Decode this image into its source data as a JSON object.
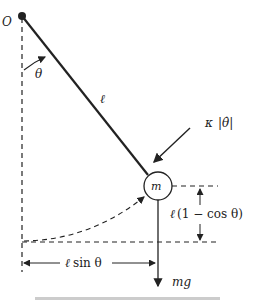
{
  "diagram": {
    "labels": {
      "pivot": "O",
      "angle": "θ",
      "length": "ℓ",
      "mass": "m",
      "damping_k": "κ",
      "damping_theta": "θ̇",
      "height_l": "ℓ",
      "height_expr": "(1 − cos θ)",
      "horizontal_l": "ℓ",
      "horizontal_expr": "sin θ",
      "weight": "mg"
    },
    "colors": {
      "line": "#222222",
      "background": "#ffffff"
    }
  }
}
